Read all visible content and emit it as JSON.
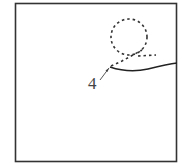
{
  "figure": {
    "type": "patent-style line drawing",
    "frame": "square border",
    "elements": [
      {
        "kind": "dashed-circle",
        "name": "phantom-circle"
      },
      {
        "kind": "dashed-line",
        "name": "phantom-line"
      },
      {
        "kind": "solid-curve",
        "name": "solid-curve"
      }
    ],
    "callouts": [
      {
        "label": "4",
        "points_to": "solid-curve start"
      }
    ],
    "colors": {
      "stroke": "#333333",
      "background": "#ffffff",
      "label": "#444444"
    }
  }
}
